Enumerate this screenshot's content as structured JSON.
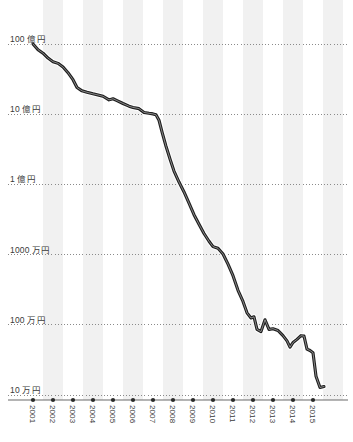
{
  "chart_data": {
    "type": "line",
    "title": "",
    "subtitle": "",
    "xlabel": "",
    "ylabel": "",
    "scale": "log",
    "grid": true,
    "legend": null,
    "ylim": [
      100000,
      10000000000
    ],
    "xlim": [
      2001,
      2015.6
    ],
    "y_tick_values": [
      10000000000,
      1000000000,
      100000000,
      10000000,
      1000000,
      100000
    ],
    "y_tick_labels": [
      "100 億円",
      "10 億円",
      "1 億円",
      "1000 万円",
      "100 万円",
      "10 万円"
    ],
    "categories": [
      "2001",
      "2002",
      "2003",
      "2004",
      "2005",
      "2006",
      "2007",
      "2008",
      "2009",
      "2010",
      "2011",
      "2012",
      "2013",
      "2014",
      "2015"
    ],
    "x_tick_labels": [
      "2001",
      "2002",
      "2003",
      "2004",
      "2005",
      "2006",
      "2007",
      "2008",
      "2009",
      "2010",
      "2011",
      "2012",
      "2013",
      "2014",
      "2015"
    ],
    "series": [
      {
        "name": "value",
        "color": "#1f1f1f",
        "points": [
          {
            "x": 2001.0,
            "y": 10000000000
          },
          {
            "x": 2001.25,
            "y": 8300000000
          },
          {
            "x": 2001.5,
            "y": 7400000000
          },
          {
            "x": 2001.75,
            "y": 6300000000
          },
          {
            "x": 2002.0,
            "y": 5600000000
          },
          {
            "x": 2002.25,
            "y": 5300000000
          },
          {
            "x": 2002.5,
            "y": 4700000000
          },
          {
            "x": 2002.75,
            "y": 3900000000
          },
          {
            "x": 2003.0,
            "y": 3100000000
          },
          {
            "x": 2003.2,
            "y": 2400000000
          },
          {
            "x": 2003.45,
            "y": 2150000000
          },
          {
            "x": 2003.7,
            "y": 2050000000
          },
          {
            "x": 2004.0,
            "y": 1950000000
          },
          {
            "x": 2004.25,
            "y": 1880000000
          },
          {
            "x": 2004.5,
            "y": 1800000000
          },
          {
            "x": 2004.8,
            "y": 1600000000
          },
          {
            "x": 2005.0,
            "y": 1660000000
          },
          {
            "x": 2005.2,
            "y": 1560000000
          },
          {
            "x": 2005.5,
            "y": 1420000000
          },
          {
            "x": 2005.8,
            "y": 1300000000
          },
          {
            "x": 2006.0,
            "y": 1250000000
          },
          {
            "x": 2006.3,
            "y": 1200000000
          },
          {
            "x": 2006.55,
            "y": 1060000000
          },
          {
            "x": 2006.8,
            "y": 1030000000
          },
          {
            "x": 2007.0,
            "y": 1010000000
          },
          {
            "x": 2007.15,
            "y": 980000000
          },
          {
            "x": 2007.3,
            "y": 820000000
          },
          {
            "x": 2007.45,
            "y": 560000000
          },
          {
            "x": 2007.65,
            "y": 350000000
          },
          {
            "x": 2007.85,
            "y": 230000000
          },
          {
            "x": 2008.05,
            "y": 155000000
          },
          {
            "x": 2008.3,
            "y": 108000000
          },
          {
            "x": 2008.55,
            "y": 78000000
          },
          {
            "x": 2008.8,
            "y": 54000000
          },
          {
            "x": 2009.05,
            "y": 37000000
          },
          {
            "x": 2009.3,
            "y": 27000000
          },
          {
            "x": 2009.55,
            "y": 20000000
          },
          {
            "x": 2009.8,
            "y": 15500000
          },
          {
            "x": 2010.0,
            "y": 13000000
          },
          {
            "x": 2010.25,
            "y": 12300000
          },
          {
            "x": 2010.5,
            "y": 10200000
          },
          {
            "x": 2010.75,
            "y": 7300000
          },
          {
            "x": 2011.0,
            "y": 5000000
          },
          {
            "x": 2011.25,
            "y": 3100000
          },
          {
            "x": 2011.5,
            "y": 2150000
          },
          {
            "x": 2011.7,
            "y": 1480000
          },
          {
            "x": 2011.9,
            "y": 1250000
          },
          {
            "x": 2012.05,
            "y": 1300000
          },
          {
            "x": 2012.2,
            "y": 860000
          },
          {
            "x": 2012.4,
            "y": 800000
          },
          {
            "x": 2012.6,
            "y": 1180000
          },
          {
            "x": 2012.8,
            "y": 860000
          },
          {
            "x": 2013.0,
            "y": 880000
          },
          {
            "x": 2013.25,
            "y": 830000
          },
          {
            "x": 2013.5,
            "y": 700000
          },
          {
            "x": 2013.7,
            "y": 590000
          },
          {
            "x": 2013.85,
            "y": 480000
          },
          {
            "x": 2014.0,
            "y": 560000
          },
          {
            "x": 2014.2,
            "y": 620000
          },
          {
            "x": 2014.4,
            "y": 700000
          },
          {
            "x": 2014.55,
            "y": 690000
          },
          {
            "x": 2014.7,
            "y": 450000
          },
          {
            "x": 2014.85,
            "y": 430000
          },
          {
            "x": 2015.0,
            "y": 400000
          },
          {
            "x": 2015.15,
            "y": 185000
          },
          {
            "x": 2015.35,
            "y": 128000
          },
          {
            "x": 2015.55,
            "y": 132000
          }
        ]
      }
    ]
  },
  "style": {
    "line_color": "#1f1f1f",
    "line_halo_color": "#ffffff",
    "grid_color": "#8a8a8a",
    "band_color": "#f1f1f1",
    "axis_color": "#6b6b6b",
    "tick_dot_color": "#2b2b2b",
    "label_color": "#3a3a3a",
    "background": "#ffffff"
  }
}
